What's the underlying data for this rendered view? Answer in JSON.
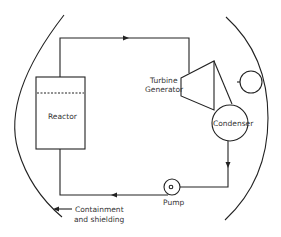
{
  "diagram": {
    "type": "nuclear power plant schematic",
    "labels": {
      "reactor": "Reactor",
      "turbine_line1": "Turbine",
      "turbine_line2": "Generator",
      "condenser": "Condenser",
      "pump": "Pump",
      "containment_line1": "Containment",
      "containment_line2": "and shielding"
    },
    "flow_direction": [
      "reactor",
      "turbine",
      "condenser",
      "pump",
      "reactor"
    ],
    "colors": {
      "line": "#222222",
      "text": "#333333",
      "background": "#ffffff"
    }
  }
}
